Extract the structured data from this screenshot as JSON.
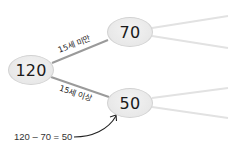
{
  "diagram": {
    "type": "tree",
    "root": {
      "value": "120"
    },
    "children": [
      {
        "value": "70",
        "edge_label": "15세 미만"
      },
      {
        "value": "50",
        "edge_label": "15세 이상"
      }
    ],
    "annotation": {
      "text": "120 – 70 = 50",
      "points_to": "50"
    }
  },
  "colors": {
    "node_fill": "#e8e8e8",
    "node_border": "#d2d2d2",
    "edge": "#9a9a9a",
    "faded_edge": "#e2e2e2",
    "arrow": "#222222"
  }
}
